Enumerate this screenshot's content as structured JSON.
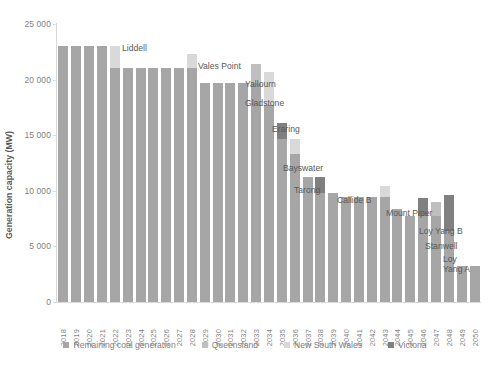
{
  "chart_data": {
    "type": "bar",
    "stacked": true,
    "title": "",
    "xlabel": "",
    "ylabel": "Generation capacity (MW)",
    "ylim": [
      0,
      25000
    ],
    "ytick_labels": [
      "0",
      "5 000",
      "10 000",
      "15 000",
      "20 000",
      "25 000"
    ],
    "ytick_values": [
      0,
      5000,
      10000,
      15000,
      20000,
      25000
    ],
    "grid": false,
    "legend_position": "bottom",
    "categories": [
      "2018",
      "2019",
      "2020",
      "2021",
      "2022",
      "2023",
      "2024",
      "2025",
      "2026",
      "2027",
      "2028",
      "2029",
      "2030",
      "2031",
      "2032",
      "2033",
      "2034",
      "2035",
      "2036",
      "2037",
      "2038",
      "2039",
      "2040",
      "2041",
      "2042",
      "2043",
      "2044",
      "2045",
      "2046",
      "2047",
      "2048",
      "2049",
      "2050"
    ],
    "series": [
      {
        "name": "Remaining coal generation",
        "color": "#a6a6a6",
        "values": [
          23000,
          23000,
          23000,
          23000,
          21000,
          21000,
          21000,
          21000,
          21000,
          21000,
          21000,
          19700,
          19700,
          19700,
          19700,
          19700,
          17700,
          14700,
          13300,
          11200,
          9800,
          9800,
          9400,
          9400,
          9400,
          9400,
          8400,
          7700,
          7700,
          7700,
          6400,
          3200,
          3200
        ]
      },
      {
        "name": "Queensland",
        "color": "#bfbfbf",
        "values": [
          0,
          0,
          0,
          0,
          0,
          0,
          0,
          0,
          0,
          0,
          0,
          0,
          0,
          0,
          0,
          1700,
          0,
          0,
          0,
          0,
          0,
          0,
          0,
          0,
          0,
          0,
          0,
          0,
          0,
          1300,
          0,
          0,
          0
        ]
      },
      {
        "name": "New South Wales",
        "color": "#d9d9d9",
        "values": [
          0,
          0,
          0,
          0,
          2000,
          0,
          0,
          0,
          0,
          0,
          1300,
          0,
          0,
          0,
          0,
          0,
          3000,
          0,
          1400,
          0,
          0,
          0,
          0,
          0,
          0,
          1000,
          0,
          0,
          0,
          0,
          0,
          0,
          0
        ]
      },
      {
        "name": "Victoria",
        "color": "#808080",
        "values": [
          0,
          0,
          0,
          0,
          0,
          0,
          0,
          0,
          0,
          0,
          0,
          0,
          0,
          0,
          0,
          0,
          0,
          1400,
          0,
          0,
          1400,
          0,
          0,
          0,
          0,
          0,
          0,
          0,
          1700,
          0,
          3200,
          0,
          0
        ]
      }
    ],
    "annotations": [
      {
        "label": "Liddell",
        "year": "2022",
        "x": 122,
        "y": 44
      },
      {
        "label": "Vales Point",
        "year": "2028",
        "x": 198,
        "y": 62
      },
      {
        "label": "Yallourn",
        "year": "2035",
        "x": 245,
        "y": 80
      },
      {
        "label": "Gladstone",
        "year": "2033",
        "x": 245,
        "y": 99
      },
      {
        "label": "Eraring",
        "year": "2034",
        "x": 272,
        "y": 125
      },
      {
        "label": "Bayswater",
        "year": "2036",
        "x": 283,
        "y": 164
      },
      {
        "label": "Tarong",
        "year": "2038",
        "x": 294,
        "y": 186
      },
      {
        "label": "Callide B",
        "year": "2040",
        "x": 337,
        "y": 196
      },
      {
        "label": "Mount Piper",
        "year": "2043",
        "x": 386,
        "y": 209
      },
      {
        "label": "Loy Yang B",
        "year": "2046",
        "x": 419,
        "y": 227
      },
      {
        "label": "Stanwell",
        "year": "2047",
        "x": 425,
        "y": 242
      },
      {
        "label": "Loy\nYang A",
        "year": "2048",
        "x": 443,
        "y": 255
      }
    ]
  },
  "legend": {
    "items": [
      {
        "label": "Remaining coal generation",
        "color": "#a6a6a6"
      },
      {
        "label": "Queensland",
        "color": "#bfbfbf"
      },
      {
        "label": "New South Wales",
        "color": "#d9d9d9"
      },
      {
        "label": "Victoria",
        "color": "#808080"
      }
    ]
  }
}
